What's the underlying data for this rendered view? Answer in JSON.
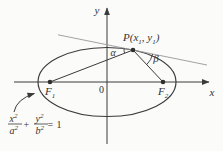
{
  "diagram": {
    "colors": {
      "ink": "#3a3a3a",
      "tangent_line": "#979797",
      "text": "#333333",
      "background": "#fbfbfa"
    },
    "axes": {
      "x_label": "x",
      "y_label": "y",
      "origin_label": "0"
    },
    "point_p": {
      "prefix": "P(x",
      "sub_1": "1",
      "separator": ", y",
      "sub_2": "1",
      "suffix": ")"
    },
    "focus_1": {
      "base": "F",
      "sub": "1"
    },
    "focus_2": {
      "base": "F",
      "sub": "2"
    },
    "angles": {
      "alpha": "α",
      "beta": "β"
    },
    "equation": {
      "num_1": "x",
      "num_1_exp": "2",
      "den_1": "a",
      "den_1_exp": "2",
      "plus": "+",
      "num_2": "y",
      "num_2_exp": "2",
      "den_2": "b",
      "den_2_exp": "2",
      "equals": "=",
      "result": "1"
    }
  }
}
